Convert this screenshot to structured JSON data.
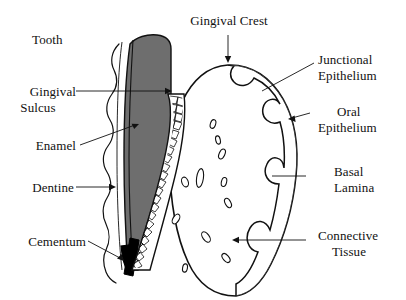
{
  "figure": {
    "background_color": "#ffffff",
    "ink_color": "#111111",
    "enamel_fill_color": "#6e6e6e",
    "cementum_fill_color": "#000000",
    "epithelium_fill_color": "#ffffff"
  },
  "labels": {
    "tooth": "Tooth",
    "gingival_sulcus_line1": "Gingival",
    "gingival_sulcus_line2": "Sulcus",
    "enamel": "Enamel",
    "dentine": "Dentine",
    "cementum": "Cementum",
    "gingival_crest": "Gingival Crest",
    "junctional_epithelium_line1": "Junctional",
    "junctional_epithelium_line2": "Epithelium",
    "oral_epithelium_line1": "Oral",
    "oral_epithelium_line2": "Epithelium",
    "basal_lamina_line1": "Basal",
    "basal_lamina_line2": "Lamina",
    "connective_tissue_line1": "Connective",
    "connective_tissue_line2": "Tissue"
  },
  "structures": [
    {
      "name": "tooth",
      "label": "Tooth",
      "description": "Grey filled tooth crown and tapering root"
    },
    {
      "name": "gingival-sulcus",
      "label": "Gingival Sulcus",
      "description": "Space between tooth surface and gingiva"
    },
    {
      "name": "enamel",
      "label": "Enamel",
      "description": "Grey crown region of the tooth"
    },
    {
      "name": "dentine",
      "label": "Dentine",
      "description": "Inner tooth body"
    },
    {
      "name": "cementum",
      "label": "Cementum",
      "description": "Black root tip covering"
    },
    {
      "name": "gingival-crest",
      "label": "Gingival Crest",
      "description": "Apex of the gingival tissue"
    },
    {
      "name": "junctional-epithelium",
      "label": "Junctional Epithelium",
      "description": "Cellular band attaching gingiva to tooth"
    },
    {
      "name": "oral-epithelium",
      "label": "Oral Epithelium",
      "description": "Outer stratified cellular layer of gingiva"
    },
    {
      "name": "basal-lamina",
      "label": "Basal Lamina",
      "description": "Boundary between epithelium and connective tissue"
    },
    {
      "name": "connective-tissue",
      "label": "Connective Tissue",
      "description": "Inner region with scattered cells"
    }
  ]
}
